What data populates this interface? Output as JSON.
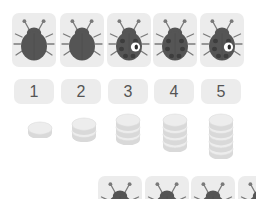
{
  "app": {
    "title": "Counting Ladybugs",
    "background_color": "#ffffff",
    "tile_color": "#ececec",
    "bug_body_color": "#555555",
    "bug_spot_color": "#3d3d3d",
    "bug_eye_color": "#ffffff",
    "disc_color": "#e8e8e8",
    "number_text_color": "#555555"
  },
  "ladybug_row": {
    "name": "ladybug-row",
    "items": [
      {
        "index": 1,
        "spots": 0,
        "eye": false,
        "x": 12,
        "y": 13
      },
      {
        "index": 2,
        "spots": 0,
        "eye": false,
        "x": 60,
        "y": 13
      },
      {
        "index": 3,
        "spots": 6,
        "eye": true,
        "x": 107,
        "y": 13
      },
      {
        "index": 4,
        "spots": 6,
        "eye": false,
        "x": 153,
        "y": 13
      },
      {
        "index": 5,
        "spots": 6,
        "eye": true,
        "x": 200,
        "y": 13
      }
    ]
  },
  "number_row": {
    "name": "number-row",
    "items": [
      {
        "label": "1",
        "x": 14,
        "y": 79
      },
      {
        "label": "2",
        "x": 61,
        "y": 79
      },
      {
        "label": "3",
        "x": 108,
        "y": 79
      },
      {
        "label": "4",
        "x": 154,
        "y": 79
      },
      {
        "label": "5",
        "x": 201,
        "y": 79
      }
    ]
  },
  "disc_row": {
    "name": "disc-stack-row",
    "items": [
      {
        "count": 1,
        "x": 26,
        "y": 120
      },
      {
        "count": 2,
        "x": 70,
        "y": 116
      },
      {
        "count": 3,
        "x": 114,
        "y": 112
      },
      {
        "count": 4,
        "x": 161,
        "y": 112
      },
      {
        "count": 5,
        "x": 207,
        "y": 112
      }
    ]
  },
  "bottom_row": {
    "name": "bottom-ladybug-row",
    "items": [
      {
        "index": 1,
        "x": 98,
        "y": 176
      },
      {
        "index": 2,
        "x": 145,
        "y": 176
      },
      {
        "index": 3,
        "x": 191,
        "y": 176
      },
      {
        "index": 4,
        "x": 238,
        "y": 176
      }
    ]
  }
}
